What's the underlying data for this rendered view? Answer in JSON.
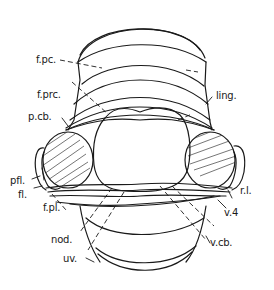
{
  "figure": {
    "stroke_color": "#1a1a1a",
    "background": "#ffffff"
  },
  "labels": {
    "f_pc": "f.pc.",
    "f_prc": "f.prc.",
    "p_cb": "p.cb.",
    "ling": "ling.",
    "pfl": "pfl.",
    "fl": "fl.",
    "f_pl": "f.pl.",
    "nod": "nod.",
    "uv": "uv.",
    "r_l": "r.l.",
    "v_4": "v.4",
    "v_cb": "v.cb."
  }
}
